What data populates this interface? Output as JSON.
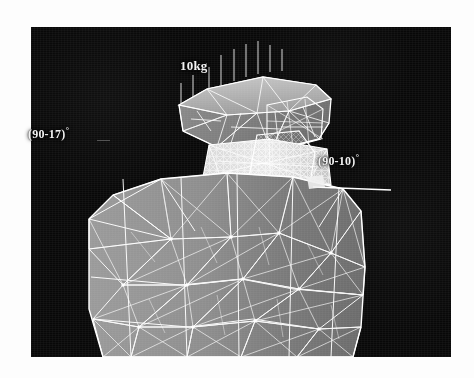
{
  "figure": {
    "kind": "finite-element-mesh-render",
    "caption_text": "",
    "plate": {
      "background_color": "#080808",
      "mesh_line_color": "#ffffff",
      "body_fill_color": "#8a8a8a",
      "body_shade_color": "#6e6e6e",
      "head_fill_color": "#7d7d7d",
      "dense_mesh_color": "#eaeaea"
    }
  },
  "annotations": {
    "load_label": "10kg",
    "angle_left": "(90-17)",
    "angle_left_unit": "°",
    "angle_right": "(90-10)",
    "angle_right_unit": "°"
  },
  "markers": {
    "load_arrow_count": 9,
    "reference_line_label": ""
  },
  "parts": [
    {
      "name": "upper-plate-structure",
      "description": "anvil-like upper block with triangular surface mesh"
    },
    {
      "name": "neck-dense-mesh",
      "description": "fine high-density mesh connector region"
    },
    {
      "name": "lower-body-block",
      "description": "large shaded block with triangular surface mesh"
    }
  ]
}
